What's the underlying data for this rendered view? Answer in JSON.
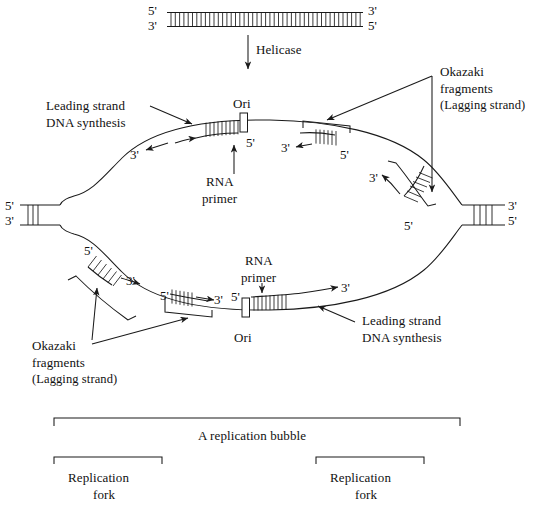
{
  "figure": {
    "title_absent": true,
    "type": "dna-replication-bubble-diagram"
  },
  "labels": {
    "helicase": "Helicase",
    "ori_top": "Ori",
    "ori_bottom": "Ori",
    "rna_primer_top_line1": "RNA",
    "rna_primer_top_line2": "primer",
    "rna_primer_bottom_line1": "RNA",
    "rna_primer_bottom_line2": "primer",
    "leading_top_line1": "Leading strand",
    "leading_top_line2": "DNA synthesis",
    "leading_bottom_line1": "Leading strand",
    "leading_bottom_line2": "DNA synthesis",
    "okazaki_top_line1": "Okazaki",
    "okazaki_top_line2": "fragments",
    "okazaki_top_line3": "(Lagging strand)",
    "okazaki_bottom_line1": "Okazaki",
    "okazaki_bottom_line2": "fragments",
    "okazaki_bottom_line3": "(Lagging strand)",
    "replication_bubble": "A replication bubble",
    "replication_fork_left_line1": "Replication",
    "replication_fork_left_line2": "fork",
    "replication_fork_right_line1": "Replication",
    "replication_fork_right_line2": "fork"
  },
  "polarity_marks": {
    "duplex_top_left_5": "5'",
    "duplex_top_left_3": "3'",
    "duplex_top_right_3": "3'",
    "duplex_top_right_5": "5'",
    "fork_left_5": "5'",
    "fork_left_3": "3'",
    "fork_right_3": "3'",
    "fork_right_5": "5'",
    "ori_top_5": "5'",
    "upper_leading_3": "3'",
    "upper_okazaki1_3": "3'",
    "upper_okazaki1_5": "5'",
    "upper_okazaki2_3": "3'",
    "upper_okazaki2_5": "5'",
    "lower_okazaki1_5": "5'",
    "lower_okazaki1_3": "3'",
    "lower_okazaki2_5": "5'",
    "lower_okazaki2_3": "3'",
    "ori_bottom_5": "5'",
    "lower_leading_3": "3'"
  },
  "colors": {
    "stroke": "#1a1a1a",
    "background": "#ffffff",
    "text": "#111111"
  },
  "geometry": {
    "canvas_width": 541,
    "canvas_height": 522,
    "parent_duplex_rung_count": 45,
    "fork_rung_count": 4
  }
}
